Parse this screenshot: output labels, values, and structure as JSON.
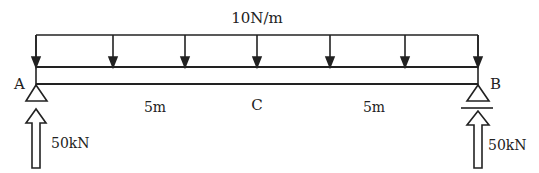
{
  "diagram": {
    "type": "simply-supported-beam",
    "load": {
      "label": "10N/m",
      "kind": "uniformly-distributed",
      "arrow_x": [
        36,
        113,
        185,
        257,
        330,
        405,
        478
      ]
    },
    "supports": [
      {
        "label": "A",
        "type": "pin"
      },
      {
        "label": "B",
        "type": "roller"
      }
    ],
    "midpoint": {
      "label": "C"
    },
    "spans": [
      {
        "label": "5m"
      },
      {
        "label": "5m"
      }
    ],
    "reactions": [
      {
        "at": "A",
        "label": "50kN"
      },
      {
        "at": "B",
        "label": "50kN"
      }
    ],
    "colors": {
      "stroke": "#222222",
      "background": "#ffffff"
    }
  }
}
